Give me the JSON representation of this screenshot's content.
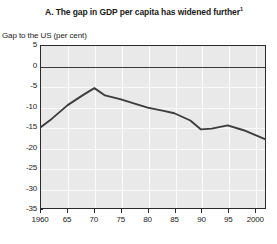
{
  "chart_data": {
    "type": "line",
    "title": "A. The gap in GDP per capita has widened further",
    "title_superscript": "1",
    "subtitle": "",
    "ylabel": "Gap to the US (per cent)",
    "xlabel": "",
    "ylim": [
      -35,
      5
    ],
    "xlim": [
      1960,
      2002
    ],
    "grid": true,
    "legend": "none",
    "y_ticks": [
      5,
      0,
      -5,
      -10,
      -15,
      -20,
      -25,
      -30,
      -35
    ],
    "y_tick_labels": [
      "5",
      "0",
      "-5",
      "-10",
      "-15",
      "-20",
      "-25",
      "-30",
      "-35"
    ],
    "x_ticks": [
      1960,
      1965,
      1970,
      1975,
      1980,
      1985,
      1990,
      1995,
      2000
    ],
    "x_tick_labels": [
      "1960",
      "65",
      "70",
      "75",
      "80",
      "85",
      "90",
      "95",
      "2000"
    ],
    "x": [
      1960,
      1962,
      1965,
      1968,
      1970,
      1972,
      1975,
      1978,
      1980,
      1983,
      1985,
      1988,
      1990,
      1992,
      1995,
      1998,
      2000,
      2002
    ],
    "values": [
      -15.0,
      -13.0,
      -9.6,
      -7.0,
      -5.4,
      -7.2,
      -8.2,
      -9.4,
      -10.2,
      -11.0,
      -11.6,
      -13.4,
      -15.6,
      -15.4,
      -14.6,
      -15.8,
      -16.9,
      -18.0
    ],
    "series": [
      {
        "name": "Gap to the US (per cent)",
        "color": "#3c3c3c",
        "values": [
          -15.0,
          -13.0,
          -9.6,
          -7.0,
          -5.4,
          -7.2,
          -8.2,
          -9.4,
          -10.2,
          -11.0,
          -11.6,
          -13.4,
          -15.6,
          -15.4,
          -14.6,
          -15.8,
          -16.9,
          -18.0
        ]
      }
    ],
    "zero_reference_line": 0,
    "plot_background": "#e9e9e9",
    "gridline_color": "#fbfbfb",
    "axis_color": "#2b2b2b"
  }
}
